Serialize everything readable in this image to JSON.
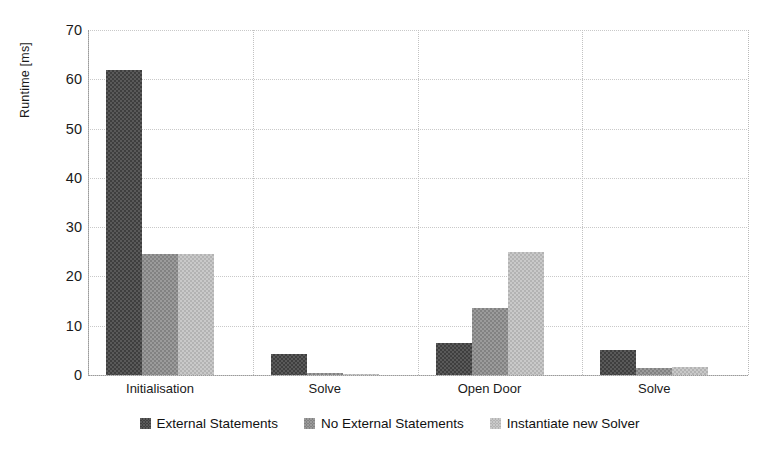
{
  "chart_data": {
    "type": "bar",
    "title": "",
    "xlabel": "",
    "ylabel": "Runtime [ms]",
    "categories": [
      "Initialisation",
      "Solve",
      "Open Door",
      "Solve"
    ],
    "series": [
      {
        "name": "External Statements",
        "values": [
          61.8,
          4.2,
          6.5,
          5.0
        ],
        "color": "#5a5a5a"
      },
      {
        "name": "No External Statements",
        "values": [
          24.5,
          0.4,
          13.5,
          1.5
        ],
        "color": "#9b9b9b"
      },
      {
        "name": "Instantiate new Solver",
        "values": [
          24.5,
          0.3,
          25.0,
          1.6
        ],
        "color": "#c9c9c9"
      }
    ],
    "ylim": [
      0,
      70
    ],
    "yticks": [
      0,
      10,
      20,
      30,
      40,
      50,
      60,
      70
    ],
    "ytick_labels": [
      "0",
      "10",
      "20",
      "30",
      "40",
      "50",
      "60",
      "70"
    ],
    "grid": "horizontal-and-vertical-dotted",
    "legend_position": "bottom-center"
  },
  "legend": {
    "items": [
      {
        "label": "External Statements"
      },
      {
        "label": "No External Statements"
      },
      {
        "label": "Instantiate new Solver"
      }
    ]
  }
}
